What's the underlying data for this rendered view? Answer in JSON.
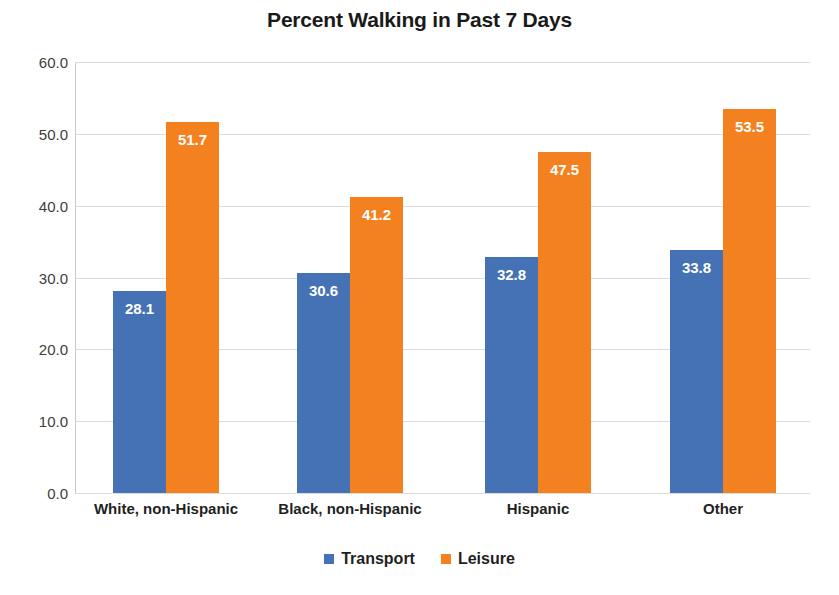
{
  "chart_data": {
    "type": "bar",
    "title": "Percent Walking in Past 7 Days",
    "xlabel": "",
    "ylabel": "",
    "ylim": [
      0,
      60
    ],
    "ytick_step": 10,
    "ytick_labels": [
      "60.0",
      "50.0",
      "40.0",
      "30.0",
      "20.0",
      "10.0",
      "0.0"
    ],
    "ytick_values": [
      60,
      50,
      40,
      30,
      20,
      10,
      0
    ],
    "grid": true,
    "legend_position": "bottom",
    "categories": [
      "White, non-Hispanic",
      "Black, non-Hispanic",
      "Hispanic",
      "Other"
    ],
    "series": [
      {
        "name": "Transport",
        "color": "#4472b4",
        "values": [
          28.1,
          30.6,
          32.8,
          33.8
        ],
        "labels": [
          "28.1",
          "30.6",
          "32.8",
          "33.8"
        ]
      },
      {
        "name": "Leisure",
        "color": "#f4811f",
        "values": [
          51.7,
          41.2,
          47.5,
          53.5
        ],
        "labels": [
          "51.7",
          "41.2",
          "47.5",
          "53.5"
        ]
      }
    ]
  },
  "colors": {
    "transport": "#4472b4",
    "leisure": "#f4811f",
    "gridline": "#dcdcdc",
    "axis": "#c9c9c9",
    "text": "#1f1f1f",
    "background": "#ffffff"
  }
}
